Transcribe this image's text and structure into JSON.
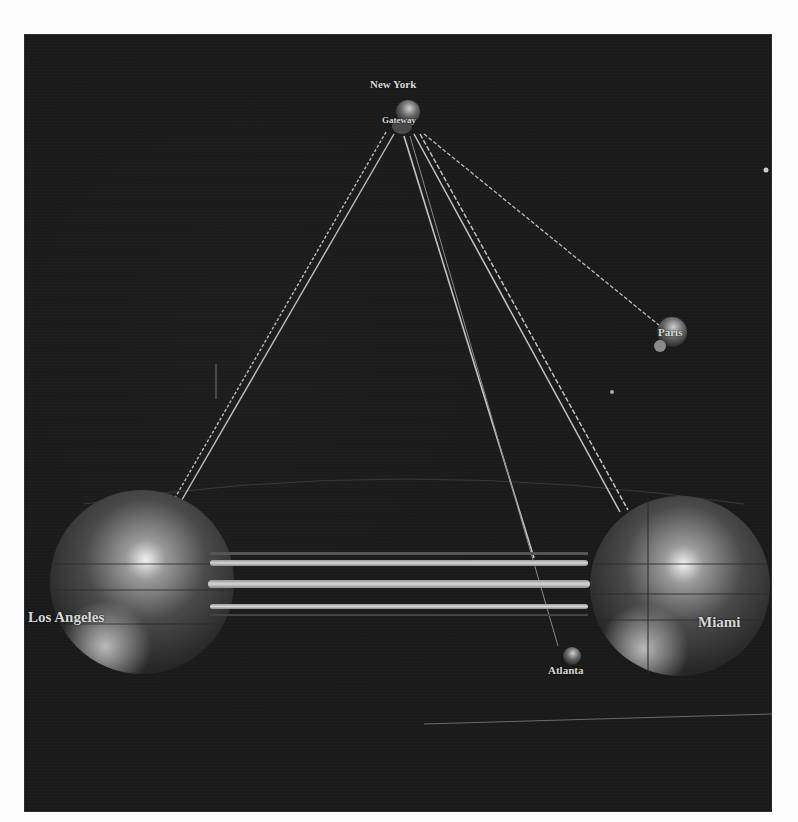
{
  "diagram": {
    "type": "3d-network-graph",
    "background": "#1a1a1a",
    "nodes": [
      {
        "id": "new-york",
        "label": "New York",
        "sublabel": "Gateway",
        "x": 384,
        "y": 84,
        "r": 14
      },
      {
        "id": "paris",
        "label": "Paris",
        "x": 646,
        "y": 300,
        "r": 16
      },
      {
        "id": "los-angeles",
        "label": "Los Angeles",
        "x": 118,
        "y": 548,
        "r": 92
      },
      {
        "id": "miami",
        "label": "Miami",
        "x": 656,
        "y": 552,
        "r": 90
      },
      {
        "id": "atlanta",
        "label": "Atlanta",
        "x": 548,
        "y": 626,
        "r": 9
      }
    ],
    "links": [
      {
        "from": "new-york",
        "to": "los-angeles",
        "style": "dashed-double"
      },
      {
        "from": "new-york",
        "to": "paris",
        "style": "dashed"
      },
      {
        "from": "new-york",
        "to": "miami",
        "style": "double"
      },
      {
        "from": "new-york",
        "to": "atlanta",
        "style": "single"
      },
      {
        "from": "los-angeles",
        "to": "miami",
        "style": "triple-bar"
      }
    ]
  },
  "labels": {
    "new_york": "New York",
    "gateway": "Gateway",
    "paris": "Paris",
    "los_angeles": "Los Angeles",
    "miami": "Miami",
    "atlanta": "Atlanta"
  }
}
